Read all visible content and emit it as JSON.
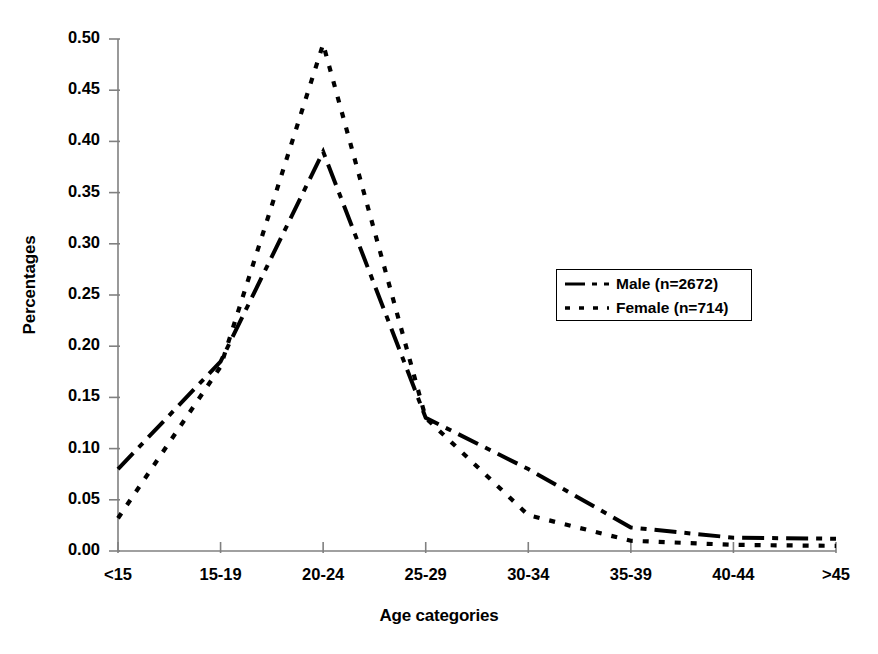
{
  "chart_data": {
    "type": "line",
    "title": "",
    "xlabel": "Age categories",
    "ylabel": "Percentages",
    "categories": [
      "<15",
      "15-19",
      "20-24",
      "25-29",
      "30-34",
      "35-39",
      "40-44",
      ">45"
    ],
    "series": [
      {
        "name": "Male (n=2672)",
        "legend_label": "Male (n=2672)",
        "line_style": "dash-dot",
        "color": "#000000",
        "values": [
          0.08,
          0.185,
          0.39,
          0.13,
          0.08,
          0.023,
          0.013,
          0.012
        ]
      },
      {
        "name": "Female (n=714)",
        "legend_label": "Female (n=714)",
        "line_style": "dotted",
        "color": "#000000",
        "values": [
          0.032,
          0.18,
          0.495,
          0.13,
          0.035,
          0.01,
          0.006,
          0.005
        ]
      }
    ],
    "ylim": [
      0.0,
      0.5
    ],
    "ytick_labels": [
      "0.50",
      "0.45",
      "0.40",
      "0.35",
      "0.30",
      "0.25",
      "0.20",
      "0.15",
      "0.10",
      "0.05",
      "0.00"
    ],
    "ytick_values": [
      0.5,
      0.45,
      0.4,
      0.35,
      0.3,
      0.25,
      0.2,
      0.15,
      0.1,
      0.05,
      0.0
    ],
    "grid": false,
    "legend_position": "center-right",
    "axis_color": "#808080"
  }
}
